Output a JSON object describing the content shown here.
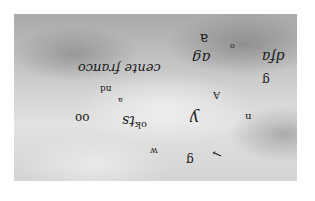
{
  "image": {
    "description": "Upside-down and scattered handwritten/typographic letters floating against a cloudy grey sky",
    "background_color": "#ffffff",
    "sky_colors": [
      "#a9a9a9",
      "#c8c8c8",
      "#e2e2e2"
    ],
    "ink_color": "#1a1a1a"
  },
  "glyphs": [
    {
      "text": "cente franco",
      "x": 78,
      "y": 60,
      "size": 13
    },
    {
      "text": "a",
      "x": 200,
      "y": 30,
      "size": 14
    },
    {
      "text": "o",
      "x": 230,
      "y": 38,
      "size": 8
    },
    {
      "text": "ag",
      "x": 192,
      "y": 48,
      "size": 15
    },
    {
      "text": "dfa",
      "x": 262,
      "y": 48,
      "size": 14
    },
    {
      "text": "g",
      "x": 262,
      "y": 70,
      "size": 12
    },
    {
      "text": "nd",
      "x": 100,
      "y": 80,
      "size": 9
    },
    {
      "text": "a",
      "x": 118,
      "y": 90,
      "size": 8
    },
    {
      "text": "–",
      "x": 88,
      "y": 60,
      "size": 9
    },
    {
      "text": "A",
      "x": 213,
      "y": 86,
      "size": 10
    },
    {
      "text": "oo",
      "x": 75,
      "y": 108,
      "size": 12
    },
    {
      "text": "ok",
      "x": 135,
      "y": 115,
      "size": 10
    },
    {
      "text": "ts",
      "x": 122,
      "y": 112,
      "size": 14
    },
    {
      "text": "y",
      "x": 190,
      "y": 108,
      "size": 16
    },
    {
      "text": "n",
      "x": 245,
      "y": 106,
      "size": 10
    },
    {
      "text": "w",
      "x": 150,
      "y": 140,
      "size": 9
    },
    {
      "text": "g",
      "x": 186,
      "y": 150,
      "size": 12
    },
    {
      "text": "←",
      "x": 212,
      "y": 145,
      "size": 12
    }
  ]
}
